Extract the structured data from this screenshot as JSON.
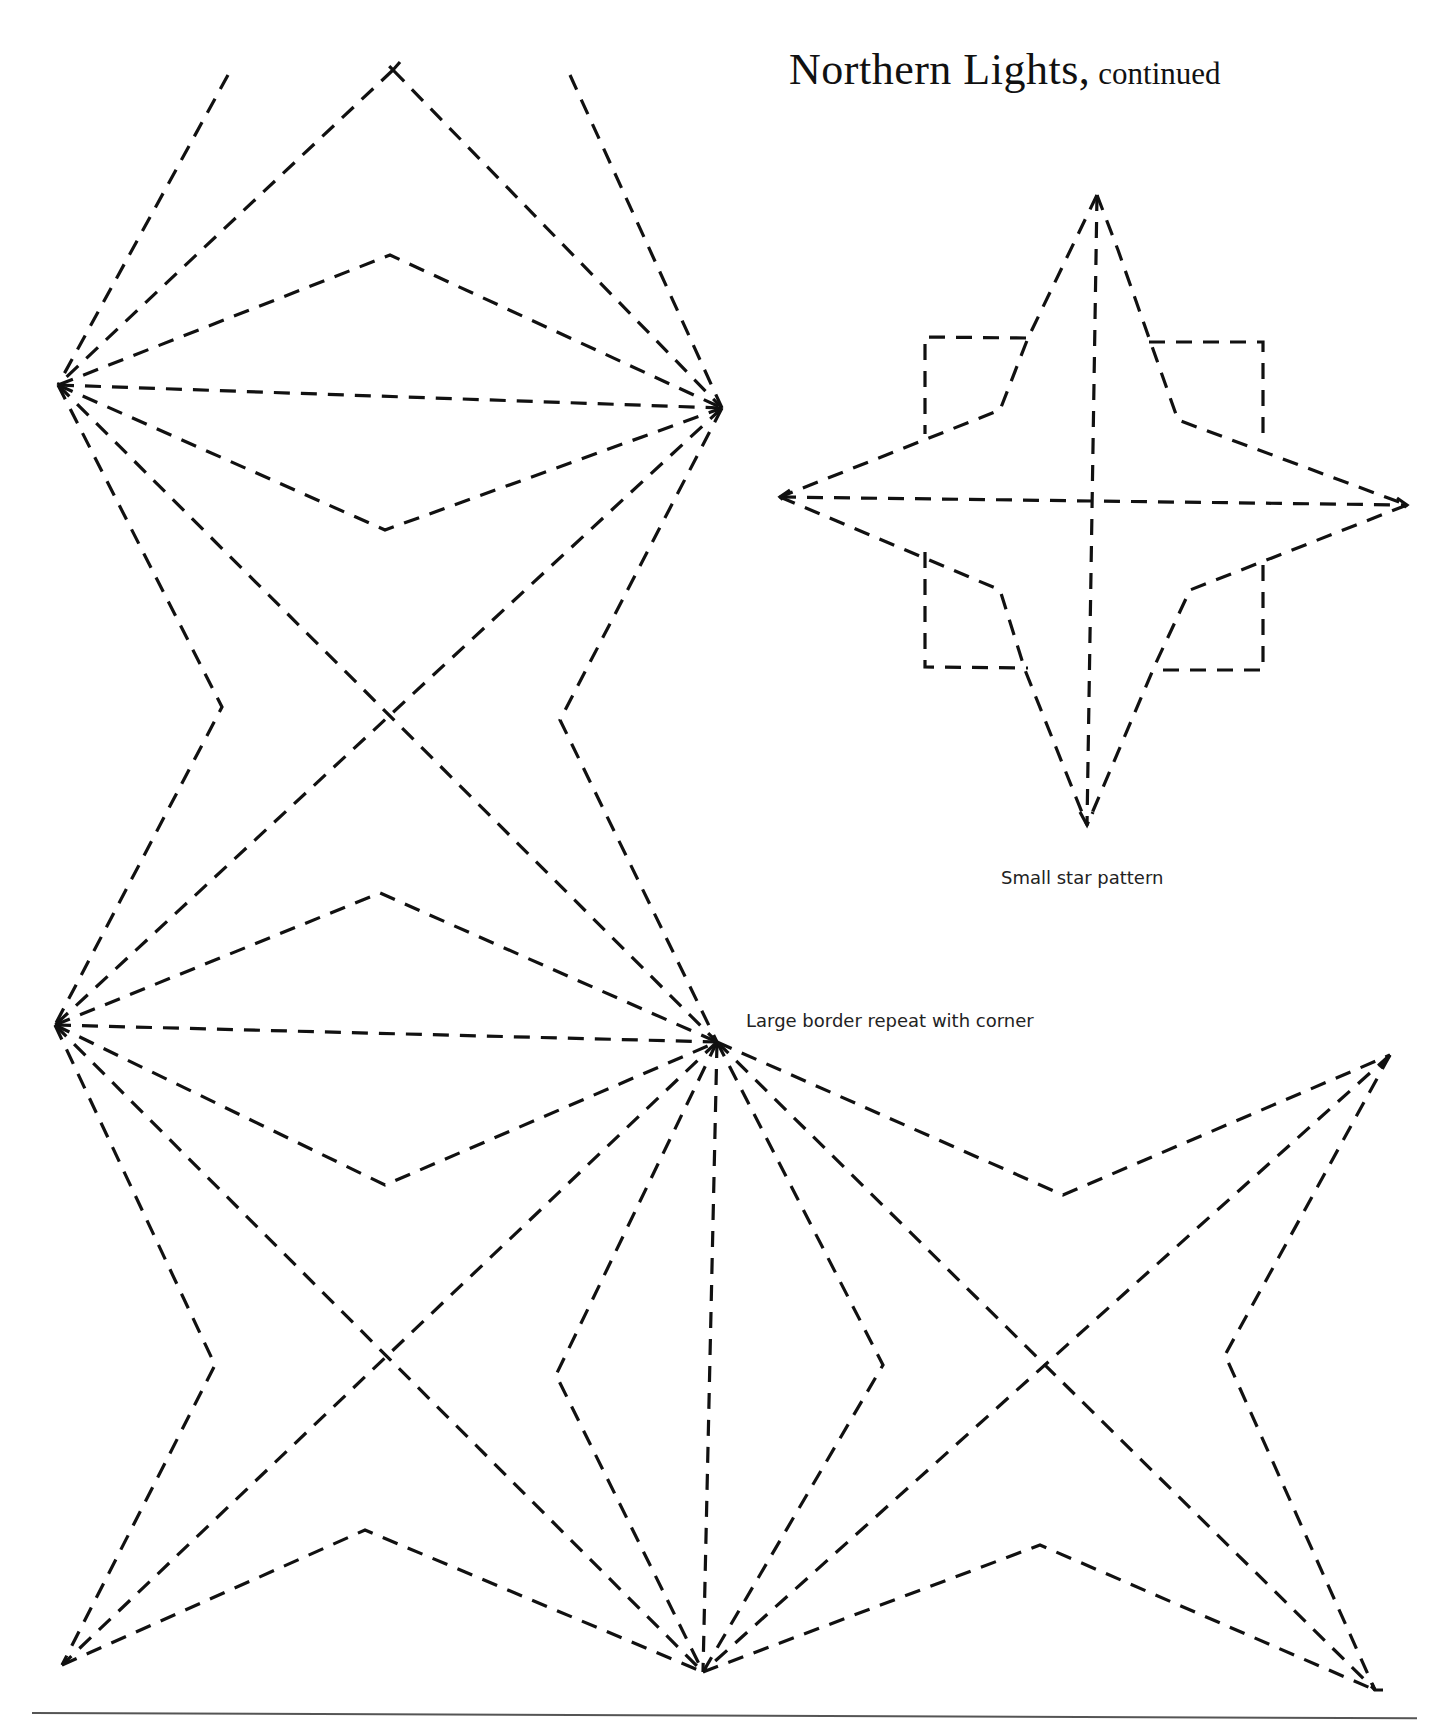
{
  "page": {
    "title": "Northern Lights,",
    "title_suffix": "continued",
    "captions": {
      "small_star": "Small star pattern",
      "large_border": "Large border repeat with corner"
    },
    "colors": {
      "ink": "#111111",
      "background": "#ffffff",
      "rule": "#555555"
    }
  },
  "patterns": {
    "large_border": {
      "paths": [
        "M228,75 L58,385",
        "M393,70 L58,385",
        "M570,75 L722,408",
        "M393,70 L722,408",
        "M400,62 L393,70 L385,62",
        "M58,385 L390,255 L722,408",
        "M58,385 L722,408",
        "M58,385 L385,530 L722,408",
        "M58,385 L222,707 L55,1025",
        "M58,385 L717,1042",
        "M722,408 L55,1025",
        "M722,408 L560,720 L717,1042",
        "M55,1025 L380,893 L717,1042",
        "M55,1025 L717,1042",
        "M55,1025 L385,1185 L717,1042",
        "M55,1025 L215,1365 L62,1665",
        "M55,1025 L703,1672",
        "M717,1042 L62,1665",
        "M717,1042 L556,1375 L703,1672",
        "M717,1042 L703,1672",
        "M717,1042 L883,1365 L703,1672",
        "M717,1042 L1375,1690",
        "M717,1042 L1063,1195 L1390,1055",
        "M1390,1055 L703,1672",
        "M1390,1055 L1225,1355 L1375,1690",
        "M62,1665 L365,1530 L703,1672",
        "M703,1672 L1040,1545 L1375,1690",
        "M1390,1055 L1377,1072",
        "M1383,1690 L1375,1690 L1370,1680"
      ]
    },
    "small_star": {
      "paths": [
        "M1097,195 L1087,825",
        "M780,497 L1407,505",
        "M1097,195 L1028,338 L1000,410 L780,497",
        "M1097,195 L1118,250 L1178,420 L1407,505",
        "M780,497 L1000,590 L1025,670 L1087,825",
        "M1407,505 L1190,590 L1155,665 L1087,825",
        "M1026,338 L925,337 L925,434",
        "M1149,342 L1263,342 L1263,444",
        "M925,552 L925,667 L1028,668",
        "M1263,565 L1263,670 L1155,670",
        "M790,490 L780,497 L790,506",
        "M1397,498 L1407,505 L1397,513",
        "M1080,812 L1087,825 L1093,812"
      ]
    }
  }
}
